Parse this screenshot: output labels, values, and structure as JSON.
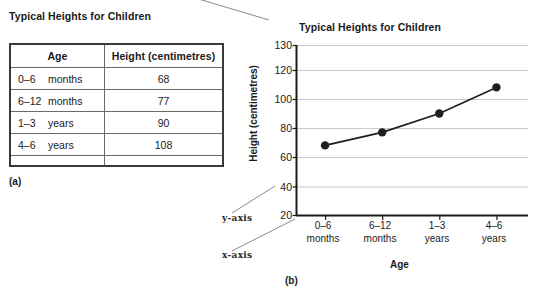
{
  "panel_a": {
    "label": "(a)",
    "caption": "Typical Heights for Children",
    "table": {
      "headers": [
        "Age",
        "Height (centimetres)"
      ],
      "rows": [
        {
          "age_range": "0–6",
          "age_unit": "months",
          "height": "68"
        },
        {
          "age_range": "6–12",
          "age_unit": "months",
          "height": "77"
        },
        {
          "age_range": "1–3",
          "age_unit": "years",
          "height": "90"
        },
        {
          "age_range": "4–6",
          "age_unit": "years",
          "height": "108"
        }
      ]
    }
  },
  "panel_b": {
    "label": "(b)",
    "annotations": {
      "y_axis_callout": "y-axis",
      "x_axis_callout": "x-axis"
    }
  },
  "chart_data": {
    "type": "line",
    "title": "Typical Heights for Children",
    "xlabel": "Age",
    "ylabel": "Height (centimetres)",
    "categories": [
      "0–6 months",
      "6–12 months",
      "1–3 years",
      "4–6 years"
    ],
    "category_lines": [
      [
        "0–6",
        "months"
      ],
      [
        "6–12",
        "months"
      ],
      [
        "1–3",
        "years"
      ],
      [
        "4–6",
        "years"
      ]
    ],
    "values": [
      68,
      77,
      90,
      108
    ],
    "ytick_labels": [
      "20",
      "40",
      "60",
      "80",
      "100",
      "120",
      "130"
    ],
    "ytick_values": [
      20,
      40,
      60,
      80,
      100,
      120,
      130
    ],
    "ylim": [
      20,
      130
    ],
    "grid": true,
    "legend": "none",
    "marker": "filled-circle",
    "line_color": "#1f1f1f",
    "marker_color": "#1f1f1f",
    "grid_color": "#c9c9c9",
    "axis_color": "#1a1a1a"
  }
}
